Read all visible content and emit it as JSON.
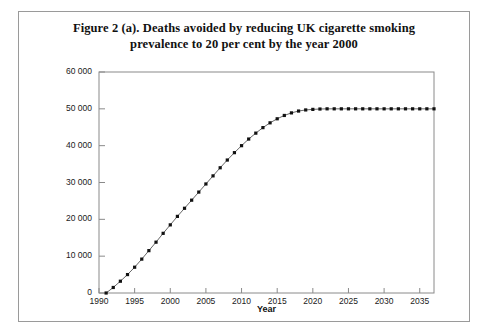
{
  "figure": {
    "title_line1": "Figure 2 (a). Deaths avoided by reducing UK cigarette smoking",
    "title_line2": "prevalence to 20 per cent by the year 2000"
  },
  "chart_data": {
    "type": "line",
    "title": "Figure 2 (a). Deaths avoided by reducing UK cigarette smoking prevalence to 20 per cent by the year 2000",
    "xlabel": "Year",
    "ylabel": "",
    "xlim": [
      1990,
      2037
    ],
    "ylim": [
      0,
      60000
    ],
    "grid": false,
    "legend": "none",
    "marker": "square",
    "line_color": "#555555",
    "marker_color": "#111111",
    "xticks": [
      1990,
      1995,
      2000,
      2005,
      2010,
      2015,
      2020,
      2025,
      2030,
      2035
    ],
    "xtick_labels": [
      "1990",
      "1995",
      "2000",
      "2005",
      "2010",
      "2015",
      "2020",
      "2025",
      "2030",
      "2035"
    ],
    "yticks": [
      0,
      10000,
      20000,
      30000,
      40000,
      50000,
      60000
    ],
    "ytick_labels": [
      "0",
      "10 000",
      "20 000",
      "30 000",
      "40 000",
      "50 000",
      "60 000"
    ],
    "x": [
      1991,
      1992,
      1993,
      1994,
      1995,
      1996,
      1997,
      1998,
      1999,
      2000,
      2001,
      2002,
      2003,
      2004,
      2005,
      2006,
      2007,
      2008,
      2009,
      2010,
      2011,
      2012,
      2013,
      2014,
      2015,
      2016,
      2017,
      2018,
      2019,
      2020,
      2021,
      2022,
      2023,
      2024,
      2025,
      2026,
      2027,
      2028,
      2029,
      2030,
      2031,
      2032,
      2033,
      2034,
      2035,
      2036,
      2037
    ],
    "values": [
      0,
      1500,
      3200,
      5000,
      7000,
      9200,
      11500,
      13800,
      16200,
      18500,
      20800,
      23000,
      25200,
      27400,
      29600,
      31800,
      34000,
      36100,
      38100,
      40000,
      41800,
      43400,
      44900,
      46200,
      47300,
      48200,
      48900,
      49400,
      49700,
      49850,
      49950,
      50000,
      50000,
      50000,
      50000,
      50000,
      50000,
      50000,
      50000,
      50000,
      50000,
      50000,
      50000,
      50000,
      50000,
      50000,
      50000
    ]
  }
}
